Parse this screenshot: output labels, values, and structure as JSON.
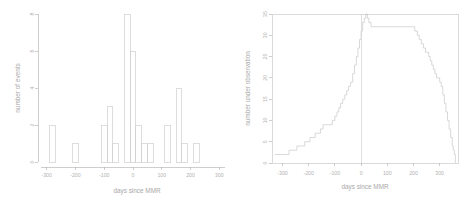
{
  "figure": {
    "background_color": "#ffffff",
    "line_color": "#c8c8c8",
    "text_color": "#b0b0b0",
    "panels": 2
  },
  "chart_data": [
    {
      "type": "bar",
      "panel": "left",
      "title": "",
      "xlabel": "days since MMR",
      "ylabel": "number of events",
      "xlim": [
        -330,
        330
      ],
      "ylim": [
        0,
        8
      ],
      "xticks": [
        -300,
        -200,
        -100,
        0,
        100,
        200,
        300
      ],
      "xtick_labels": [
        "-300",
        "-200",
        "-100",
        "0",
        "100",
        "200",
        "300"
      ],
      "yticks": [
        0,
        2,
        4,
        6,
        8
      ],
      "ytick_labels": [
        "0",
        "2",
        "4",
        "6",
        "8"
      ],
      "grid": false,
      "legend": "none",
      "bin_width": 20,
      "bin_starts": [
        -310,
        -290,
        -270,
        -250,
        -230,
        -210,
        -190,
        -170,
        -150,
        -130,
        -110,
        -90,
        -70,
        -50,
        -30,
        -10,
        10,
        30,
        50,
        70,
        90,
        110,
        130,
        150,
        170,
        190,
        210,
        230,
        250,
        270,
        290,
        310
      ],
      "values": [
        0,
        2,
        0,
        0,
        0,
        1,
        0,
        0,
        0,
        0,
        2,
        3,
        1,
        0,
        8,
        6,
        2,
        1,
        1,
        0,
        0,
        2,
        0,
        4,
        1,
        0,
        1,
        0,
        0,
        0,
        0,
        0
      ],
      "categories": [
        "-310",
        "-290",
        "-270",
        "-250",
        "-230",
        "-210",
        "-190",
        "-170",
        "-150",
        "-130",
        "-110",
        "-90",
        "-70",
        "-50",
        "-30",
        "-10",
        "10",
        "30",
        "50",
        "70",
        "90",
        "110",
        "130",
        "150",
        "170",
        "190",
        "210",
        "230",
        "250",
        "270",
        "290",
        "310"
      ]
    },
    {
      "type": "line",
      "panel": "right",
      "title": "",
      "xlabel": "days since MMR",
      "ylabel": "number under observation",
      "xlim": [
        -340,
        370
      ],
      "ylim": [
        0,
        35
      ],
      "xticks": [
        -300,
        -200,
        -100,
        0,
        100,
        200,
        300
      ],
      "xtick_labels": [
        "-300",
        "-200",
        "-100",
        "0",
        "100",
        "200",
        "300"
      ],
      "yticks": [
        0,
        5,
        10,
        15,
        20,
        25,
        30,
        35
      ],
      "ytick_labels": [
        "0",
        "5",
        "10",
        "15",
        "20",
        "25",
        "30",
        "35"
      ],
      "grid": false,
      "legend": "none",
      "step": true,
      "vline_at_x": 0,
      "x": [
        -330,
        -300,
        -275,
        -260,
        -245,
        -230,
        -215,
        -205,
        -195,
        -185,
        -175,
        -165,
        -155,
        -145,
        -140,
        -130,
        -120,
        -110,
        -100,
        -92,
        -85,
        -78,
        -70,
        -62,
        -55,
        -48,
        -40,
        -32,
        -25,
        -18,
        -12,
        -6,
        0,
        6,
        12,
        18,
        24,
        30,
        38,
        48,
        60,
        75,
        95,
        120,
        150,
        175,
        195,
        205,
        215,
        222,
        230,
        238,
        246,
        252,
        258,
        264,
        270,
        276,
        282,
        288,
        294,
        300,
        306,
        312,
        318,
        324,
        330,
        336,
        342,
        348,
        352,
        356,
        360
      ],
      "y": [
        2,
        2,
        3,
        3,
        4,
        4,
        5,
        5,
        6,
        6,
        7,
        7,
        8,
        9,
        9,
        9,
        9,
        10,
        11,
        12,
        13,
        14,
        15,
        16,
        17,
        18,
        19,
        21,
        23,
        25,
        27,
        29,
        31,
        33,
        34,
        35,
        34,
        33,
        32,
        32,
        32,
        32,
        32,
        32,
        32,
        32,
        32,
        31,
        30,
        29,
        28,
        27,
        26,
        26,
        25,
        24,
        23,
        22,
        21,
        20,
        20,
        19,
        18,
        16,
        14,
        12,
        10,
        8,
        6,
        4,
        3,
        2,
        0
      ]
    }
  ]
}
